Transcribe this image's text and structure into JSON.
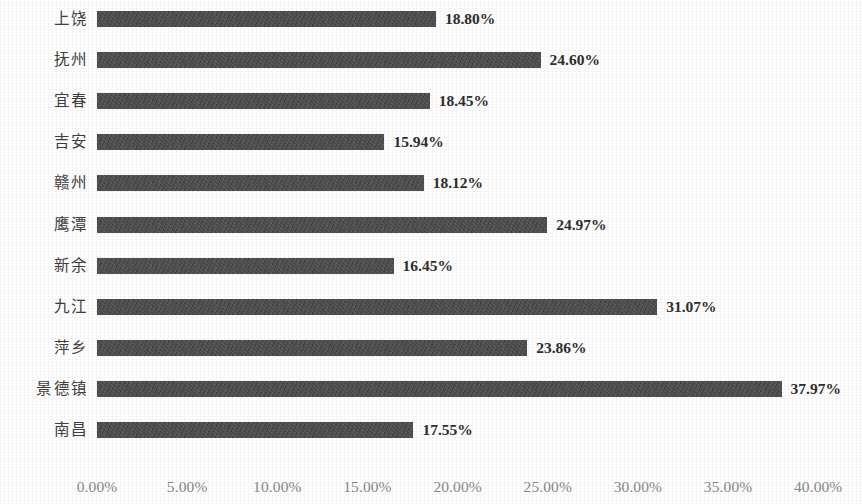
{
  "chart_data": {
    "type": "bar",
    "orientation": "horizontal",
    "title": "",
    "subtitle": "",
    "xlabel": "",
    "ylabel": "",
    "grid": false,
    "legend": false,
    "legend_position": "none",
    "value_format": "percent",
    "value_suffix": "%",
    "xlim": [
      0,
      40
    ],
    "xticks": [
      0,
      5,
      10,
      15,
      20,
      25,
      30,
      35,
      40
    ],
    "xtick_labels": [
      "0.00%",
      "5.00%",
      "10.00%",
      "15.00%",
      "20.00%",
      "25.00%",
      "30.00%",
      "35.00%",
      "40.00%"
    ],
    "categories": [
      "上饶",
      "抚州",
      "宜春",
      "吉安",
      "赣州",
      "鹰潭",
      "新余",
      "九江",
      "萍乡",
      "景德镇",
      "南昌"
    ],
    "values": [
      18.8,
      24.6,
      18.45,
      15.94,
      18.12,
      24.97,
      16.45,
      31.07,
      23.86,
      37.97,
      17.55
    ],
    "data_labels": [
      "18.80%",
      "24.60%",
      "18.45%",
      "15.94%",
      "18.12%",
      "24.97%",
      "16.45%",
      "31.07%",
      "23.86%",
      "37.97%",
      "17.55%"
    ],
    "bar_color": "#4b4b4b",
    "label_color": "#2e2e2e",
    "tick_color": "#8a8a8a",
    "background_color": "#ffffff"
  }
}
